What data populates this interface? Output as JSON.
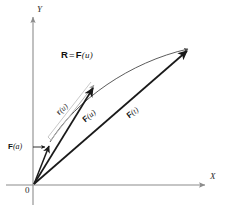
{
  "figure": {
    "background_color": "#ffffff",
    "axes": {
      "x_label": "X",
      "y_label": "Y",
      "origin_label": "0",
      "axis_color": "#8c8c8c"
    },
    "equation": {
      "bold_r": "R",
      "equals": "=",
      "bold_f": "F",
      "arg_open": "(",
      "arg": "u",
      "arg_close": ")"
    },
    "vectors": [
      {
        "name": "F(a)",
        "bold_part": "F",
        "arg": "(a)",
        "color": "#1a1a1a",
        "description": "short position vector from origin"
      },
      {
        "name": "F(u)",
        "bold_part": "F",
        "arg": "(u)",
        "color": "#1a1a1a",
        "description": "medium position vector from origin"
      },
      {
        "name": "F(t)",
        "bold_part": "F",
        "arg": "(t)",
        "color": "#1a1a1a",
        "description": "long position vector from origin"
      },
      {
        "name": "r(u)",
        "bold_part": "r",
        "arg": "(u)",
        "color": "#7a7a7a",
        "description": "light chord vector from F(a) tip to F(u) tip"
      }
    ],
    "curve": {
      "name": "space-curve",
      "color": "#4a4a4a",
      "description": "arc traced by the tip of F"
    }
  }
}
